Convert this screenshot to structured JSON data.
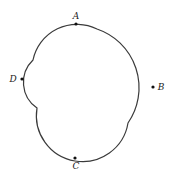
{
  "diagram": {
    "type": "closed-curve-with-labeled-points",
    "stroke_color": "#3a3a3a",
    "points": [
      {
        "label": "A",
        "x": 76,
        "y": 24,
        "label_x": 76,
        "label_y": 19
      },
      {
        "label": "B",
        "x": 153,
        "y": 87,
        "label_x": 161,
        "label_y": 90
      },
      {
        "label": "C",
        "x": 75,
        "y": 158,
        "label_x": 76,
        "label_y": 169
      },
      {
        "label": "D",
        "x": 22,
        "y": 79,
        "label_x": 13,
        "label_y": 82
      }
    ],
    "cusps": [
      {
        "x": 97,
        "y": 29
      },
      {
        "x": 128,
        "y": 123
      },
      {
        "x": 37,
        "y": 108
      },
      {
        "x": 33,
        "y": 60
      }
    ]
  }
}
